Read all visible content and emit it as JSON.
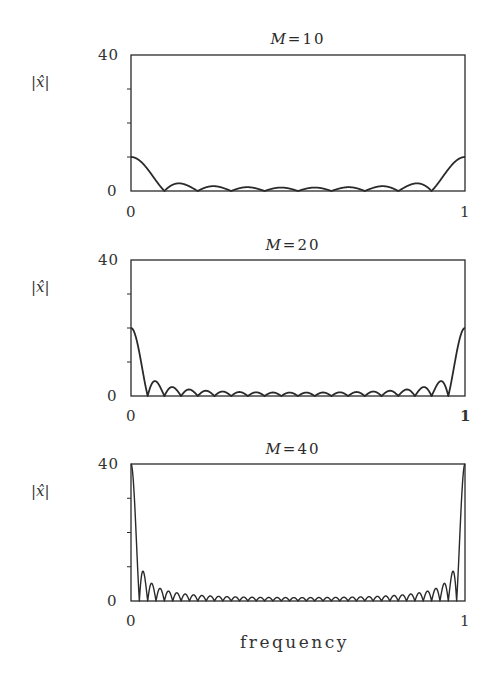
{
  "figure": {
    "xlabel": "frequency",
    "ylabel": "|x̂|",
    "line_color": "#2a2a2a"
  },
  "panels": [
    {
      "title_var": "M",
      "title_eq": "=",
      "title_val": "10",
      "ytick_top": "40",
      "ytick_bottom": "0",
      "xtick_left": "0",
      "xtick_right": "1"
    },
    {
      "title_var": "M",
      "title_eq": "=",
      "title_val": "20",
      "ytick_top": "40",
      "ytick_bottom": "0",
      "xtick_left": "0",
      "xtick_right": "1"
    },
    {
      "title_var": "M",
      "title_eq": "=",
      "title_val": "40",
      "ytick_top": "40",
      "ytick_bottom": "0",
      "xtick_left": "0",
      "xtick_right": "1"
    }
  ],
  "chart_data": [
    {
      "type": "line",
      "title": "M = 10",
      "xlabel": "",
      "ylabel": "|x̂|",
      "xlim": [
        0,
        1
      ],
      "ylim": [
        0,
        40
      ],
      "yticks": [
        0,
        10,
        20,
        30,
        40
      ],
      "ytick_labels": [
        "0",
        "",
        "",
        "",
        "40"
      ],
      "xtick_labels": [
        "0",
        "1"
      ],
      "function": "|sin(pi*M*f)/sin(pi*f)|",
      "M": 10,
      "key_points": {
        "x": [
          0,
          0.1,
          0.15,
          0.5,
          0.9,
          1
        ],
        "y": [
          10,
          0,
          2.3,
          0,
          0,
          10
        ]
      },
      "grid": false
    },
    {
      "type": "line",
      "title": "M = 20",
      "xlabel": "",
      "ylabel": "|x̂|",
      "xlim": [
        0,
        1
      ],
      "ylim": [
        0,
        40
      ],
      "yticks": [
        0,
        10,
        20,
        30,
        40
      ],
      "ytick_labels": [
        "0",
        "",
        "",
        "",
        "40"
      ],
      "xtick_labels": [
        "0",
        "1"
      ],
      "function": "|sin(pi*M*f)/sin(pi*f)|",
      "M": 20,
      "key_points": {
        "x": [
          0,
          0.05,
          0.075,
          0.5,
          0.95,
          1
        ],
        "y": [
          20,
          0,
          4.4,
          0,
          0,
          20
        ]
      },
      "grid": false
    },
    {
      "type": "line",
      "title": "M = 40",
      "xlabel": "frequency",
      "ylabel": "|x̂|",
      "xlim": [
        0,
        1
      ],
      "ylim": [
        0,
        40
      ],
      "yticks": [
        0,
        10,
        20,
        30,
        40
      ],
      "ytick_labels": [
        "0",
        "",
        "",
        "",
        "40"
      ],
      "xtick_labels": [
        "0",
        "1"
      ],
      "function": "|sin(pi*M*f)/sin(pi*f)|",
      "M": 40,
      "key_points": {
        "x": [
          0,
          0.025,
          0.0375,
          0.5,
          0.975,
          1
        ],
        "y": [
          40,
          0,
          8.5,
          0,
          0,
          40
        ]
      },
      "grid": false
    }
  ]
}
